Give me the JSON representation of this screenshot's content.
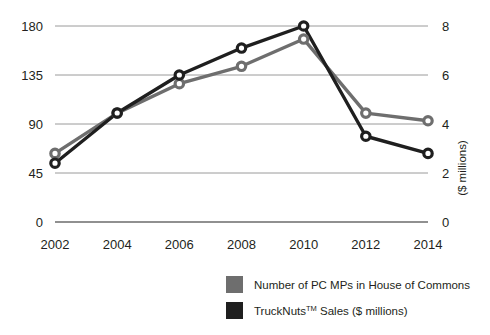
{
  "chart_data": {
    "type": "line",
    "title": "",
    "subtitle": "",
    "xlabel": "",
    "ylabel": "",
    "grid": true,
    "legend_position": "bottom",
    "categories": [
      "2002",
      "2004",
      "2006",
      "2008",
      "2010",
      "2012",
      "2014"
    ],
    "x": [
      2002,
      2004,
      2006,
      2008,
      2010,
      2012,
      2014
    ],
    "axes": {
      "x": {
        "tick_labels": [
          "2002",
          "2004",
          "2006",
          "2008",
          "2010",
          "2012",
          "2014"
        ],
        "range": [
          2002,
          2014
        ]
      },
      "left": {
        "label": "",
        "tick_labels": [
          "180",
          "135",
          "90",
          "45",
          "0"
        ],
        "ticks": [
          180,
          135,
          90,
          45,
          0
        ],
        "range": [
          0,
          180
        ]
      },
      "right": {
        "label": "($ millions)",
        "tick_labels": [
          "8",
          "6",
          "4",
          "2",
          "0"
        ],
        "ticks": [
          8,
          6,
          4,
          2,
          0
        ],
        "range": [
          0,
          8
        ]
      }
    },
    "series": [
      {
        "name": "Number of PC MPs in House of Commons",
        "axis": "left",
        "color": "#6e6e6e",
        "marker": "open-circle",
        "values": [
          63,
          100,
          127,
          143,
          168,
          100,
          93
        ]
      },
      {
        "name": "TruckNuts™ Sales ($ millions)",
        "axis": "right",
        "color": "#1f1f1f",
        "marker": "open-circle",
        "values": [
          2.4,
          4.45,
          6.0,
          7.1,
          8.0,
          3.5,
          2.8
        ]
      }
    ]
  },
  "legend": {
    "items": [
      {
        "label": "Number of PC MPs in House of Commons",
        "label_main": "Number of PC MPs in House of Commons",
        "label_sup": "",
        "label_tail": "",
        "color": "#6e6e6e"
      },
      {
        "label": "TruckNuts™ Sales ($ millions)",
        "label_main": "TruckNuts",
        "label_sup": "TM",
        "label_tail": " Sales ($ millions)",
        "color": "#1f1f1f"
      }
    ]
  },
  "colors": {
    "background": "#ffffff",
    "gridline": "#9a9a9a",
    "axis_line": "#6b6b6b",
    "series_gray": "#6e6e6e",
    "series_black": "#1f1f1f",
    "text": "#231f20"
  }
}
